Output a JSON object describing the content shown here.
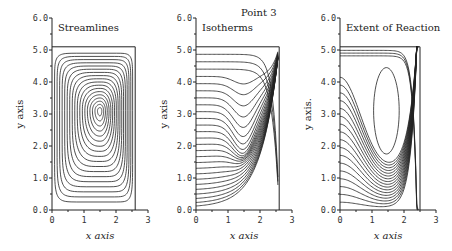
{
  "figure_title": "Point 3",
  "chart_data": [
    {
      "type": "contour",
      "title": "Streamlines",
      "xlabel": "x axis",
      "ylabel": "y axis",
      "xlim": [
        0,
        3
      ],
      "ylim": [
        0,
        6
      ],
      "xticks": [
        "0",
        "1",
        "2",
        "3"
      ],
      "yticks": [
        "0.0",
        "1.0",
        "2.0",
        "3.0",
        "4.0",
        "5.0",
        "6.0"
      ],
      "domain": {
        "x": [
          0,
          2.6
        ],
        "y": [
          0,
          5.1
        ]
      },
      "vortex_center": [
        1.5,
        3.1
      ],
      "levels": 18
    },
    {
      "type": "contour",
      "title": "Isotherms",
      "xlabel": "x axis",
      "ylabel": "y axis",
      "xlim": [
        0,
        3
      ],
      "ylim": [
        0,
        6
      ],
      "xticks": [
        "0",
        "1",
        "2",
        "3"
      ],
      "yticks": [
        "0.0",
        "1.0",
        "2.0",
        "3.0",
        "4.0",
        "5.0",
        "6.0"
      ],
      "domain": {
        "x": [
          0,
          2.6
        ],
        "y": [
          0,
          5.1
        ]
      },
      "levels": 26
    },
    {
      "type": "contour",
      "title": "Extent of Reaction",
      "xlabel": "x axis",
      "ylabel": "y axis.",
      "xlim": [
        0,
        3
      ],
      "ylim": [
        0,
        6
      ],
      "xticks": [
        "0",
        "1",
        "2",
        "3"
      ],
      "yticks": [
        "0.0",
        "1.0",
        "2.0",
        "3.0",
        "4.0",
        "5.0",
        "6.0"
      ],
      "domain": {
        "x": [
          0,
          2.5
        ],
        "y": [
          0,
          5.1
        ]
      },
      "levels": 20
    }
  ]
}
